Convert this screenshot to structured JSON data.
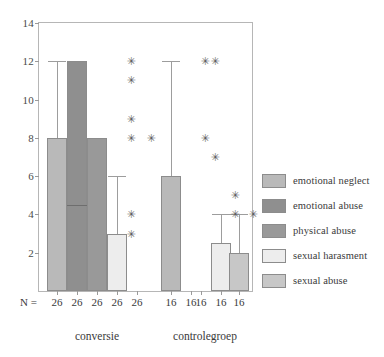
{
  "chart_data": {
    "type": "bar",
    "title": "",
    "xlabel": "",
    "ylabel": "",
    "ylim": [
      0,
      14
    ],
    "ytick_values": [
      0,
      2,
      4,
      6,
      8,
      10,
      12,
      14
    ],
    "ytick_labels": [
      "0",
      "2",
      "4",
      "6",
      "8",
      "10",
      "12",
      "14"
    ],
    "grid": false,
    "legend_position": "right",
    "categories": [
      "conversie",
      "controlegroep"
    ],
    "series": [
      {
        "name": "emotional neglect",
        "color": "#b9b9b9",
        "values": [
          8,
          6
        ],
        "whisker_high": [
          12,
          12
        ],
        "whisker_low": [
          8,
          6
        ]
      },
      {
        "name": "emotional abuse",
        "color": "#8f8f8f",
        "values": [
          12,
          0
        ],
        "whisker_high": [
          12,
          0
        ],
        "whisker_low": [
          12,
          0
        ],
        "median_line": [
          4.5,
          null
        ]
      },
      {
        "name": "physical abuse",
        "color": "#999999",
        "values": [
          8,
          0
        ],
        "whisker_high": [
          8,
          0
        ],
        "whisker_low": [
          8,
          0
        ]
      },
      {
        "name": "sexual harasment",
        "color": "#ededed",
        "values": [
          3,
          2.5
        ],
        "whisker_high": [
          6,
          4
        ],
        "whisker_low": [
          3,
          2.5
        ]
      },
      {
        "name": "sexual abuse",
        "color": "#c7c7c7",
        "values": [
          0,
          2
        ],
        "whisker_high": [
          0,
          4
        ],
        "whisker_low": [
          0,
          2
        ]
      }
    ],
    "outliers": [
      {
        "group": "conversie",
        "series": "sexual harasment",
        "value": 12
      },
      {
        "group": "conversie",
        "series": "sexual harasment",
        "value": 11
      },
      {
        "group": "conversie",
        "series": "sexual harasment",
        "value": 9
      },
      {
        "group": "conversie",
        "series": "sexual harasment",
        "value": 8
      },
      {
        "group": "conversie",
        "series": "sexual harasment",
        "value": 4
      },
      {
        "group": "conversie",
        "series": "sexual harasment",
        "value": 3
      },
      {
        "group": "conversie",
        "series": "sexual abuse",
        "value": 8
      },
      {
        "group": "controlegroep",
        "series": "emotional abuse",
        "value": 12
      },
      {
        "group": "controlegroep",
        "series": "emotional abuse",
        "value": 8
      },
      {
        "group": "controlegroep",
        "series": "physical abuse",
        "value": 12
      },
      {
        "group": "controlegroep",
        "series": "physical abuse",
        "value": 7
      },
      {
        "group": "controlegroep",
        "series": "sexual harasment",
        "value": 5
      },
      {
        "group": "controlegroep",
        "series": "sexual harasment",
        "value": 4
      },
      {
        "group": "controlegroep",
        "series": "sexual abuse",
        "value": 4
      }
    ],
    "n_label": "N =",
    "n_values_conversie": [
      "26",
      "26",
      "26",
      "26",
      "26"
    ],
    "n_values_controlegroep": [
      "16",
      "16",
      "16",
      "16",
      "16"
    ]
  },
  "axis": {
    "y_ticks": [
      "14",
      "12",
      "10",
      "8",
      "6",
      "4",
      "2"
    ]
  },
  "nrow": {
    "label": "N =",
    "values": [
      "26",
      "26",
      "26",
      "26",
      "26",
      "16",
      "16",
      "16",
      "16",
      "16"
    ]
  },
  "groups": {
    "left": "conversie",
    "right": "controlegroep"
  },
  "legend": {
    "items": [
      {
        "label": "emotional neglect",
        "color": "#b9b9b9"
      },
      {
        "label": "emotional abuse",
        "color": "#8f8f8f"
      },
      {
        "label": "physical abuse",
        "color": "#999999"
      },
      {
        "label": "sexual harasment",
        "color": "#ededed"
      },
      {
        "label": "sexual abuse",
        "color": "#c7c7c7"
      }
    ]
  }
}
